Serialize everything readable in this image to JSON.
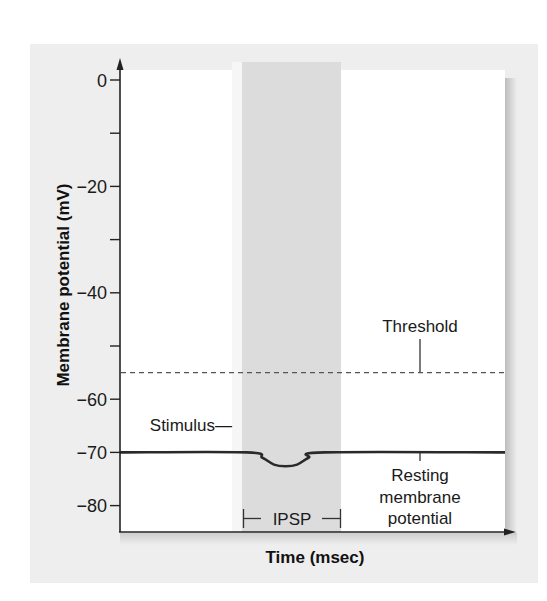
{
  "chart_data": {
    "type": "line",
    "title": "",
    "xlabel": "Time (msec)",
    "ylabel": "Membrane potential (mV)",
    "ylim": [
      -85,
      2
    ],
    "y_ticks": [
      0,
      -10,
      -20,
      -30,
      -40,
      -50,
      -60,
      -70,
      -80
    ],
    "y_tick_labels": [
      "0",
      "",
      "−20",
      "",
      "−40",
      "",
      "−60",
      "−70",
      "−80"
    ],
    "x_ticks": [],
    "grid": false,
    "legend": null,
    "series": [
      {
        "name": "Membrane potential",
        "style": "solid",
        "points": [
          {
            "t": 0.0,
            "mV": -70
          },
          {
            "t": 0.33,
            "mV": -70
          },
          {
            "t": 0.37,
            "mV": -71.0
          },
          {
            "t": 0.4,
            "mV": -72.3
          },
          {
            "t": 0.43,
            "mV": -72.6
          },
          {
            "t": 0.46,
            "mV": -72.3
          },
          {
            "t": 0.49,
            "mV": -71.0
          },
          {
            "t": 0.53,
            "mV": -70
          },
          {
            "t": 1.0,
            "mV": -70
          }
        ]
      },
      {
        "name": "Threshold",
        "style": "dashed",
        "points": [
          {
            "t": 0.0,
            "mV": -55
          },
          {
            "t": 1.0,
            "mV": -55
          }
        ]
      }
    ],
    "shaded_region": {
      "label": "IPSP",
      "t_start": 0.31,
      "t_end": 0.56,
      "color": "#dcdcdc"
    },
    "annotations": [
      {
        "text": "Threshold",
        "points_to_mV": -55
      },
      {
        "text": "Stimulus—",
        "marks_t": 0.31
      },
      {
        "text": "IPSP",
        "type": "bracket"
      },
      {
        "text": "Resting membrane potential",
        "points_to_mV": -70
      }
    ]
  },
  "labels": {
    "y_axis_title": "Membrane potential (mV)",
    "x_axis_title": "Time (msec)",
    "threshold": "Threshold",
    "stimulus": "Stimulus—",
    "ipsp": "IPSP",
    "resting_lines": [
      "Resting",
      "membrane",
      "potential"
    ]
  },
  "colors": {
    "panel": "#eeeeee",
    "plot_bg": "#ffffff",
    "band": "#dcdcdc",
    "pre_band": "#f6f6f6",
    "axis": "#222222",
    "trace": "#2a2a2a",
    "threshold": "#555555",
    "shadow": "#c8c8c8"
  }
}
